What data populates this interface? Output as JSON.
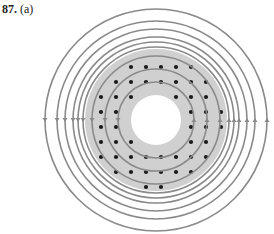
{
  "problem": {
    "number": "87.",
    "part": "(a)"
  },
  "figure": {
    "center": [
      156,
      120
    ],
    "hole_radius": 25,
    "shaded_outer_radius": 71,
    "inner_ring_radii": [
      38,
      51,
      64
    ],
    "outer_ring_radii": [
      73,
      78,
      83,
      91,
      99,
      111
    ],
    "colors": {
      "ring": "#8a8a8a",
      "shade": "#d0d0d0",
      "dot": "#1a1a1a",
      "background": "#ffffff",
      "arrow": "#8a8a8a"
    },
    "arrow_direction_left": "down",
    "arrow_direction_right": "up",
    "dot_grid_spacing": 15
  }
}
